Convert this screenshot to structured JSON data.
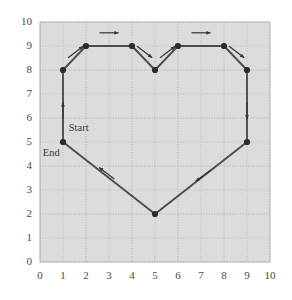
{
  "chart_data": {
    "type": "line",
    "title": "",
    "xlabel": "",
    "ylabel": "",
    "xlim": [
      0,
      10
    ],
    "ylim": [
      0,
      10
    ],
    "grid": true,
    "legend": null,
    "plot_background": "#dcdcdc",
    "grid_color": "#9a9a9a",
    "line_color": "#4d4d4d",
    "marker_color": "#2b2b2b",
    "axis_text_color": "#4a4a4a",
    "x_ticks": [
      "0",
      "1",
      "2",
      "3",
      "4",
      "5",
      "6",
      "7",
      "8",
      "9",
      "10"
    ],
    "y_ticks": [
      "0",
      "1",
      "2",
      "3",
      "4",
      "5",
      "6",
      "7",
      "8",
      "9",
      "10"
    ],
    "series": [
      {
        "name": "heart-path",
        "closed": true,
        "points": [
          {
            "x": 1,
            "y": 5
          },
          {
            "x": 1,
            "y": 8
          },
          {
            "x": 2,
            "y": 9
          },
          {
            "x": 4,
            "y": 9
          },
          {
            "x": 5,
            "y": 8
          },
          {
            "x": 6,
            "y": 9
          },
          {
            "x": 8,
            "y": 9
          },
          {
            "x": 9,
            "y": 8
          },
          {
            "x": 9,
            "y": 5
          },
          {
            "x": 5,
            "y": 2
          },
          {
            "x": 1,
            "y": 5
          }
        ]
      }
    ],
    "direction_arrows": [
      {
        "id": "arrow-up-left-side",
        "x": 1.0,
        "y": 6.3,
        "dir": "up"
      },
      {
        "id": "arrow-up-right-diagonal",
        "x": 1.55,
        "y": 8.75,
        "dir": "up-right"
      },
      {
        "id": "arrow-right-top-left",
        "x": 3.0,
        "y": 9.55,
        "dir": "right"
      },
      {
        "id": "arrow-down-right-cleft",
        "x": 4.55,
        "y": 8.75,
        "dir": "down-right"
      },
      {
        "id": "arrow-up-right-cleft",
        "x": 5.55,
        "y": 8.75,
        "dir": "up-right"
      },
      {
        "id": "arrow-right-top-right",
        "x": 7.0,
        "y": 9.55,
        "dir": "right"
      },
      {
        "id": "arrow-down-right-side",
        "x": 8.55,
        "y": 8.75,
        "dir": "down-right"
      },
      {
        "id": "arrow-down-right-edge",
        "x": 9.0,
        "y": 6.3,
        "dir": "down"
      },
      {
        "id": "arrow-down-left-lower-r",
        "x": 7.1,
        "y": 3.6,
        "dir": "down-left"
      },
      {
        "id": "arrow-up-left-lower-l",
        "x": 2.9,
        "y": 3.7,
        "dir": "up-left"
      }
    ],
    "annotations": [
      {
        "id": "start-label",
        "text": "Start",
        "x": 1.25,
        "y": 5.55
      },
      {
        "id": "end-label",
        "text": "End",
        "x": 0.12,
        "y": 4.48
      }
    ]
  }
}
